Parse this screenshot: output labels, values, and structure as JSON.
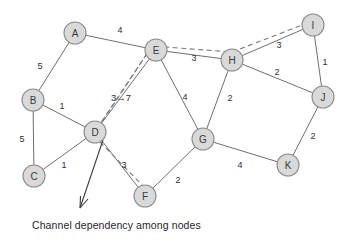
{
  "figure": {
    "caption": "Channel dependency among nodes",
    "node_fill": "#d9d9d9",
    "node_stroke": "#8c8c8c",
    "edge_color": "#6f6f6f",
    "dashed_color": "#7b7b7b"
  },
  "chart_data": {
    "type": "diagram",
    "title": "Channel dependency among nodes",
    "nodes": [
      {
        "id": "A",
        "label": "A",
        "x": 75,
        "y": 33
      },
      {
        "id": "B",
        "label": "B",
        "x": 33,
        "y": 100
      },
      {
        "id": "C",
        "label": "C",
        "x": 34,
        "y": 176
      },
      {
        "id": "D",
        "label": "D",
        "x": 95,
        "y": 132
      },
      {
        "id": "E",
        "label": "E",
        "x": 156,
        "y": 50
      },
      {
        "id": "F",
        "label": "F",
        "x": 145,
        "y": 196
      },
      {
        "id": "G",
        "label": "G",
        "x": 203,
        "y": 139
      },
      {
        "id": "H",
        "label": "H",
        "x": 232,
        "y": 60
      },
      {
        "id": "I",
        "label": "I",
        "x": 313,
        "y": 25
      },
      {
        "id": "J",
        "label": "J",
        "x": 323,
        "y": 97
      },
      {
        "id": "K",
        "label": "K",
        "x": 288,
        "y": 165
      }
    ],
    "node_radius": 11,
    "edges": [
      {
        "from": "A",
        "to": "E",
        "weight": "4",
        "lx": 120,
        "ly": 30,
        "style": "solid"
      },
      {
        "from": "A",
        "to": "B",
        "weight": "5",
        "lx": 40,
        "ly": 66,
        "style": "solid"
      },
      {
        "from": "B",
        "to": "D",
        "weight": "1",
        "lx": 62,
        "ly": 106,
        "style": "solid"
      },
      {
        "from": "B",
        "to": "C",
        "weight": "5",
        "lx": 22,
        "ly": 139,
        "style": "solid"
      },
      {
        "from": "C",
        "to": "D",
        "weight": "1",
        "lx": 64,
        "ly": 165,
        "style": "solid"
      },
      {
        "from": "D",
        "to": "E",
        "weight": "",
        "lx": 0,
        "ly": 0,
        "style": "solid"
      },
      {
        "from": "D",
        "to": "F",
        "weight": "3",
        "lx": 124,
        "ly": 165,
        "style": "solid"
      },
      {
        "from": "E",
        "to": "H",
        "weight": "3",
        "lx": 194,
        "ly": 58,
        "style": "solid"
      },
      {
        "from": "E",
        "to": "G",
        "weight": "4",
        "lx": 185,
        "ly": 97,
        "style": "solid"
      },
      {
        "from": "F",
        "to": "G",
        "weight": "2",
        "lx": 178,
        "ly": 180,
        "style": "solid"
      },
      {
        "from": "G",
        "to": "H",
        "weight": "2",
        "lx": 230,
        "ly": 98,
        "style": "solid"
      },
      {
        "from": "G",
        "to": "K",
        "weight": "4",
        "lx": 240,
        "ly": 165,
        "style": "solid"
      },
      {
        "from": "H",
        "to": "I",
        "weight": "3",
        "lx": 279,
        "ly": 45,
        "style": "solid"
      },
      {
        "from": "H",
        "to": "J",
        "weight": "2",
        "lx": 277,
        "ly": 72,
        "style": "solid"
      },
      {
        "from": "I",
        "to": "J",
        "weight": "1",
        "lx": 325,
        "ly": 62,
        "style": "solid"
      },
      {
        "from": "J",
        "to": "K",
        "weight": "2",
        "lx": 313,
        "ly": 136,
        "style": "solid"
      }
    ],
    "dashed_path": {
      "label": "D-E-H-I",
      "points": "98,128 152,46 232,52 310,22"
    },
    "annotations": [
      {
        "text": "3→7",
        "x": 121,
        "y": 97
      }
    ]
  }
}
